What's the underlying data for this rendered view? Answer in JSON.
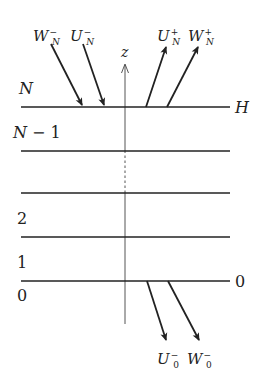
{
  "diagram": {
    "axis": {
      "label": "z"
    },
    "layers": [
      {
        "index": "N",
        "y": 107,
        "right_label": "H"
      },
      {
        "index": "N−1",
        "y": 151
      },
      {
        "index": "",
        "y": 193
      },
      {
        "index": "2",
        "y": 237
      },
      {
        "index": "1",
        "y": 281,
        "right_label": "0",
        "below_label": "0"
      }
    ],
    "labels": {
      "top_N": "N",
      "N_minus_1": "N− 1",
      "two": "2",
      "one": "1",
      "zero_left": "0",
      "zero_right": "0",
      "H": "H"
    },
    "arrows": {
      "top_incoming": [
        {
          "name": "W",
          "sub": "N",
          "sup": "−"
        },
        {
          "name": "U",
          "sub": "N",
          "sup": "−"
        }
      ],
      "top_outgoing": [
        {
          "name": "U",
          "sub": "N",
          "sup": "+"
        },
        {
          "name": "W",
          "sub": "N",
          "sup": "+"
        }
      ],
      "bottom_outgoing": [
        {
          "name": "U",
          "sub": "0",
          "sup": "−"
        },
        {
          "name": "W",
          "sub": "0",
          "sup": "−"
        }
      ]
    }
  }
}
